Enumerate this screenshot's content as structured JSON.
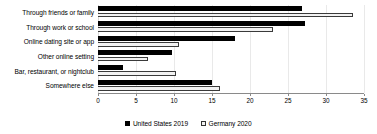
{
  "chart_data": {
    "type": "bar",
    "orientation": "horizontal",
    "title": "",
    "xlabel": "",
    "ylabel": "",
    "xlim": [
      0,
      35
    ],
    "xticks": [
      0,
      5,
      10,
      15,
      20,
      25,
      30,
      35
    ],
    "grid": true,
    "legend_position": "bottom",
    "categories": [
      "Through friends or family",
      "Through work or school",
      "Online dating site or app",
      "Other online setting",
      "Bar, restaurant, or nightclub",
      "Somewhere else"
    ],
    "series": [
      {
        "name": "United States 2019",
        "color": "#000000",
        "values": [
          26.8,
          27.2,
          18.0,
          9.8,
          3.3,
          15.0
        ]
      },
      {
        "name": "Germany 2020",
        "color": "#f2f2f2",
        "values": [
          33.5,
          23.0,
          10.6,
          6.6,
          10.3,
          16.0
        ]
      }
    ]
  },
  "legend": {
    "items": [
      {
        "label": "United States 2019",
        "icon": "solid-square-icon"
      },
      {
        "label": "Germany 2020",
        "icon": "hatched-square-icon"
      }
    ]
  }
}
